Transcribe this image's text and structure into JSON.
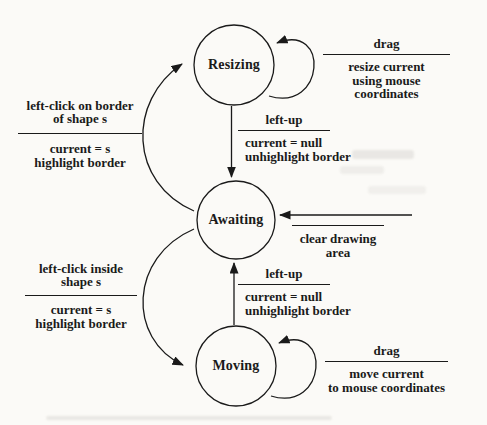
{
  "diagram": {
    "states": {
      "resizing": "Resizing",
      "awaiting": "Awaiting",
      "moving": "Moving"
    },
    "transitions": {
      "resizing_self": {
        "event": "drag",
        "action_lines": [
          "resize current",
          "using mouse coordinates"
        ]
      },
      "resizing_to_awaiting": {
        "event": "left-up",
        "action_lines": [
          "current = null",
          "unhighlight border"
        ]
      },
      "awaiting_to_resizing": {
        "event_lines": [
          "left-click on border",
          "of shape s"
        ],
        "action_lines": [
          "current = s",
          "highlight border"
        ]
      },
      "start_to_awaiting": {
        "event": "",
        "action_lines": [
          "clear drawing",
          "area"
        ]
      },
      "awaiting_to_moving": {
        "event_lines": [
          "left-click inside",
          "shape s"
        ],
        "action_lines": [
          "current = s",
          "highlight border"
        ]
      },
      "moving_to_awaiting": {
        "event": "left-up",
        "action_lines": [
          "current = null",
          "unhighlight border"
        ]
      },
      "moving_self": {
        "event": "drag",
        "action_lines": [
          "move current",
          "to mouse coordinates"
        ]
      }
    }
  },
  "colors": {
    "background": "#fbfaf7",
    "ink": "#1a1a1a"
  }
}
